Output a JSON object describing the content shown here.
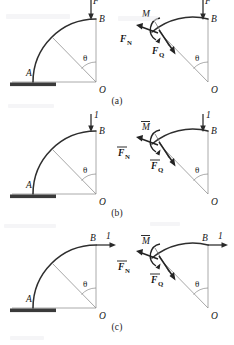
{
  "figure": {
    "rows": [
      {
        "id": "a",
        "caption": "(a)",
        "load": {
          "label": "F",
          "direction": "down",
          "applied_at": "B"
        },
        "left_panel": {
          "name": "structural-diagram-a",
          "points": [
            {
              "label": "A",
              "role": "fixed-support-end"
            },
            {
              "label": "B",
              "role": "free-end"
            },
            {
              "label": "O",
              "role": "arc-center"
            }
          ],
          "angle_label": "θ",
          "support": "fixed"
        },
        "right_panel": {
          "name": "free-body-diagram-a",
          "points": [
            {
              "label": "B",
              "role": "free-end"
            },
            {
              "label": "O",
              "role": "arc-center"
            }
          ],
          "angle_label": "θ",
          "internal_forces": [
            {
              "symbol": "M",
              "subscript": "",
              "overbar": false,
              "kind": "moment",
              "name": "bending-moment"
            },
            {
              "symbol": "F",
              "subscript": "N",
              "overbar": false,
              "kind": "force",
              "name": "axial-normal-force"
            },
            {
              "symbol": "F",
              "subscript": "Q",
              "overbar": false,
              "kind": "force",
              "name": "shear-force"
            }
          ]
        }
      },
      {
        "id": "b",
        "caption": "(b)",
        "load": {
          "label": "1",
          "direction": "down",
          "applied_at": "B"
        },
        "left_panel": {
          "name": "structural-diagram-b",
          "points": [
            {
              "label": "A",
              "role": "fixed-support-end"
            },
            {
              "label": "B",
              "role": "free-end"
            },
            {
              "label": "O",
              "role": "arc-center"
            }
          ],
          "angle_label": "θ",
          "support": "fixed"
        },
        "right_panel": {
          "name": "free-body-diagram-b",
          "points": [
            {
              "label": "B",
              "role": "free-end"
            },
            {
              "label": "O",
              "role": "arc-center"
            }
          ],
          "angle_label": "θ",
          "internal_forces": [
            {
              "symbol": "M",
              "subscript": "",
              "overbar": true,
              "kind": "moment",
              "name": "unit-bending-moment"
            },
            {
              "symbol": "F",
              "subscript": "N",
              "overbar": true,
              "kind": "force",
              "name": "unit-axial-normal-force"
            },
            {
              "symbol": "F",
              "subscript": "Q",
              "overbar": true,
              "kind": "force",
              "name": "unit-shear-force"
            }
          ]
        }
      },
      {
        "id": "c",
        "caption": "(c)",
        "load": {
          "label": "1",
          "direction": "right",
          "applied_at": "B"
        },
        "left_panel": {
          "name": "structural-diagram-c",
          "points": [
            {
              "label": "A",
              "role": "fixed-support-end"
            },
            {
              "label": "B",
              "role": "free-end"
            },
            {
              "label": "O",
              "role": "arc-center"
            }
          ],
          "angle_label": "θ",
          "support": "fixed"
        },
        "right_panel": {
          "name": "free-body-diagram-c",
          "points": [
            {
              "label": "B",
              "role": "free-end"
            },
            {
              "label": "O",
              "role": "arc-center"
            }
          ],
          "angle_label": "θ",
          "internal_forces": [
            {
              "symbol": "M",
              "subscript": "",
              "overbar": true,
              "kind": "moment",
              "name": "unit-bending-moment"
            },
            {
              "symbol": "F",
              "subscript": "N",
              "overbar": true,
              "kind": "force",
              "name": "unit-axial-normal-force"
            },
            {
              "symbol": "F",
              "subscript": "Q",
              "overbar": true,
              "kind": "force",
              "name": "unit-shear-force"
            }
          ]
        }
      }
    ]
  }
}
